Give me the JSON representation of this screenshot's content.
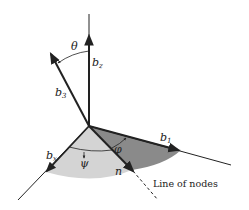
{
  "figure": {
    "type": "euler-angles-diagram",
    "colors": {
      "axis": "#222222",
      "light_sector": "#d4d4d4",
      "dark_sector": "#8a8a8a",
      "background": "#ffffff"
    },
    "axes": {
      "b_z": {
        "label": "b",
        "subscript": "z"
      },
      "b_3": {
        "label": "b",
        "subscript": "3"
      },
      "b_1": {
        "label": "b",
        "subscript": "1"
      },
      "b_x": {
        "label": "b",
        "subscript": "x"
      },
      "n": {
        "label": "n"
      }
    },
    "angles": {
      "theta": {
        "label": "θ"
      },
      "psi": {
        "label": "ψ"
      },
      "phi": {
        "label": "φ"
      }
    },
    "annotations": {
      "line_of_nodes": "Line of nodes"
    }
  }
}
